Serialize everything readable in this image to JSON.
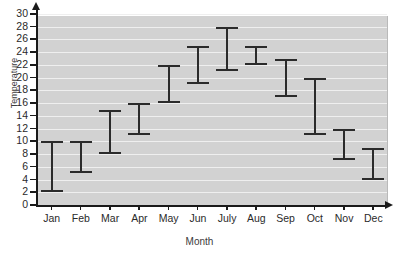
{
  "chart_data": {
    "type": "bar",
    "chart_style": "range-bar",
    "title": "",
    "xlabel": "Month",
    "ylabel": "Temperature",
    "categories": [
      "Jan",
      "Feb",
      "Mar",
      "Apr",
      "May",
      "Jun",
      "July",
      "Aug",
      "Sep",
      "Oct",
      "Nov",
      "Dec"
    ],
    "series": [
      {
        "name": "low",
        "values": [
          2,
          5,
          8,
          11,
          16,
          19,
          21,
          22,
          17,
          11,
          7,
          4
        ]
      },
      {
        "name": "high",
        "values": [
          10,
          10,
          15,
          16,
          22,
          25,
          28,
          25,
          23,
          20,
          12,
          9
        ]
      }
    ],
    "ranges": [
      {
        "category": "Jan",
        "low": 2,
        "high": 10
      },
      {
        "category": "Feb",
        "low": 5,
        "high": 10
      },
      {
        "category": "Mar",
        "low": 8,
        "high": 15
      },
      {
        "category": "Apr",
        "low": 11,
        "high": 16
      },
      {
        "category": "May",
        "low": 16,
        "high": 22
      },
      {
        "category": "Jun",
        "low": 19,
        "high": 25
      },
      {
        "category": "July",
        "low": 21,
        "high": 28
      },
      {
        "category": "Aug",
        "low": 22,
        "high": 25
      },
      {
        "category": "Sep",
        "low": 17,
        "high": 23
      },
      {
        "category": "Oct",
        "low": 11,
        "high": 20
      },
      {
        "category": "Nov",
        "low": 7,
        "high": 12
      },
      {
        "category": "Dec",
        "low": 4,
        "high": 9
      }
    ],
    "ylim": [
      0,
      30
    ],
    "ytick_step": 2,
    "yticks": [
      0,
      2,
      4,
      6,
      8,
      10,
      12,
      14,
      16,
      18,
      20,
      22,
      24,
      26,
      28,
      30
    ],
    "ytick_labels": [
      "0",
      "2",
      "4",
      "6",
      "8",
      "10",
      "12",
      "14",
      "16",
      "18",
      "20",
      "22",
      "24",
      "26",
      "28",
      "30"
    ],
    "grid": true,
    "grid_axis": "y",
    "legend": null,
    "colors": {
      "plot_background": "#d2d2d2",
      "gridline": "#efefef",
      "bar": "#2b2b2b",
      "axis": "#1a1a1a",
      "text": "#2a2a2a",
      "page_background": "#ffffff"
    }
  }
}
